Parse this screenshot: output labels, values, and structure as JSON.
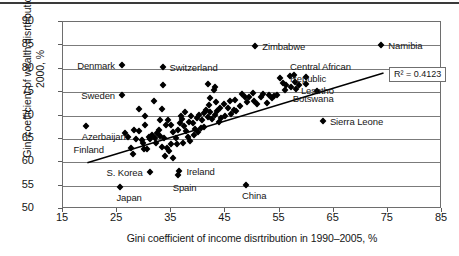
{
  "chart_data": {
    "type": "scatter",
    "title": "",
    "xlabel": "Gini coefficient of income disrtribution in 1990–2005, %",
    "ylabel": "Gini coefficient of wealth disrtribution in 2000, %",
    "xlim": [
      15,
      85
    ],
    "ylim": [
      50,
      90
    ],
    "xticks": [
      15,
      25,
      35,
      45,
      55,
      65,
      75,
      85
    ],
    "yticks": [
      50,
      55,
      60,
      65,
      70,
      75,
      80,
      85,
      90
    ],
    "grid": "horizontal",
    "legend": "none",
    "marker": "filled-diamond",
    "marker_color": "#000000",
    "trendline": {
      "type": "linear",
      "x_start": 19.5,
      "y_start": 59.9,
      "x_end": 74.2,
      "y_end": 79.1,
      "r_squared_label": "R² = 0.4123",
      "r_squared": 0.4123
    },
    "annotations": [
      {
        "label": "Namibia",
        "x": 73.8,
        "y": 85.0,
        "anchor": "right"
      },
      {
        "label": "Zimbabwe",
        "x": 50.5,
        "y": 84.8,
        "anchor": "right"
      },
      {
        "label": "Central African",
        "x": 61.0,
        "y": 80.5,
        "anchor": "none"
      },
      {
        "label": "Republic",
        "x": 61.0,
        "y": 78.0,
        "anchor": "none"
      },
      {
        "label": "Denmark",
        "x": 25.9,
        "y": 80.8,
        "anchor": "left"
      },
      {
        "label": "Switzerland",
        "x": 33.4,
        "y": 80.4,
        "anchor": "right"
      },
      {
        "label": "Lesotho",
        "x": 63.0,
        "y": 75.5,
        "anchor": "none"
      },
      {
        "label": "Botswana",
        "x": 61.5,
        "y": 73.8,
        "anchor": "none"
      },
      {
        "label": "Sweden",
        "x": 25.9,
        "y": 74.3,
        "anchor": "left"
      },
      {
        "label": "Sierra Leone",
        "x": 63.0,
        "y": 68.9,
        "anchor": "right"
      },
      {
        "label": "Azerbaijan",
        "x": 19.2,
        "y": 67.8,
        "anchor": "below"
      },
      {
        "label": "Finland",
        "x": 21.0,
        "y": 62.8,
        "anchor": "none"
      },
      {
        "label": "S. Korea",
        "x": 31.0,
        "y": 58.0,
        "anchor": "left"
      },
      {
        "label": "Ireland",
        "x": 36.5,
        "y": 58.2,
        "anchor": "right"
      },
      {
        "label": "Spain",
        "x": 36.0,
        "y": 56.9,
        "anchor": "below"
      },
      {
        "label": "Japan",
        "x": 25.6,
        "y": 54.8,
        "anchor": "below"
      },
      {
        "label": "China",
        "x": 48.8,
        "y": 55.1,
        "anchor": "below"
      }
    ],
    "points": [
      {
        "x": 73.8,
        "y": 85.0,
        "name": "Namibia"
      },
      {
        "x": 50.5,
        "y": 84.8,
        "name": "Zimbabwe"
      },
      {
        "x": 25.9,
        "y": 80.8,
        "name": "Denmark"
      },
      {
        "x": 33.4,
        "y": 80.4,
        "name": "Switzerland"
      },
      {
        "x": 25.9,
        "y": 74.3,
        "name": "Sweden"
      },
      {
        "x": 19.2,
        "y": 67.8,
        "name": "Azerbaijan"
      },
      {
        "x": 25.6,
        "y": 54.8,
        "name": "Japan"
      },
      {
        "x": 31.0,
        "y": 58.0,
        "name": "S. Korea"
      },
      {
        "x": 36.5,
        "y": 58.2,
        "name": "Ireland"
      },
      {
        "x": 36.2,
        "y": 57.3,
        "name": "Spain"
      },
      {
        "x": 48.8,
        "y": 55.1,
        "name": "China"
      },
      {
        "x": 63.0,
        "y": 68.9,
        "name": "Sierra Leone"
      },
      {
        "x": 62.0,
        "y": 75.2,
        "name": "Botswana"
      },
      {
        "x": 59.8,
        "y": 76.8,
        "name": "Central African Republic"
      },
      {
        "x": 33.5,
        "y": 76.5,
        "name": ""
      },
      {
        "x": 41.8,
        "y": 76.7,
        "name": ""
      },
      {
        "x": 43.0,
        "y": 76.0,
        "name": ""
      },
      {
        "x": 42.8,
        "y": 75.4,
        "name": ""
      },
      {
        "x": 29.0,
        "y": 71.4,
        "name": ""
      },
      {
        "x": 30.1,
        "y": 69.8,
        "name": ""
      },
      {
        "x": 31.8,
        "y": 73.1,
        "name": ""
      },
      {
        "x": 30.2,
        "y": 68.0,
        "name": ""
      },
      {
        "x": 33.3,
        "y": 71.3,
        "name": ""
      },
      {
        "x": 33.0,
        "y": 69.0,
        "name": ""
      },
      {
        "x": 42.2,
        "y": 73.8,
        "name": ""
      },
      {
        "x": 43.3,
        "y": 72.8,
        "name": ""
      },
      {
        "x": 44.0,
        "y": 71.5,
        "name": ""
      },
      {
        "x": 45.5,
        "y": 71.6,
        "name": ""
      },
      {
        "x": 46.5,
        "y": 71.2,
        "name": ""
      },
      {
        "x": 48.0,
        "y": 74.6,
        "name": ""
      },
      {
        "x": 48.6,
        "y": 74.0,
        "name": ""
      },
      {
        "x": 49.3,
        "y": 73.9,
        "name": ""
      },
      {
        "x": 50.2,
        "y": 73.2,
        "name": ""
      },
      {
        "x": 50.9,
        "y": 72.4,
        "name": ""
      },
      {
        "x": 52.0,
        "y": 74.5,
        "name": ""
      },
      {
        "x": 53.0,
        "y": 74.3,
        "name": ""
      },
      {
        "x": 54.0,
        "y": 74.1,
        "name": ""
      },
      {
        "x": 55.0,
        "y": 78.1,
        "name": ""
      },
      {
        "x": 56.2,
        "y": 76.5,
        "name": ""
      },
      {
        "x": 57.0,
        "y": 78.4,
        "name": ""
      },
      {
        "x": 57.6,
        "y": 78.6,
        "name": ""
      },
      {
        "x": 57.2,
        "y": 76.1,
        "name": ""
      },
      {
        "x": 58.0,
        "y": 75.6,
        "name": ""
      },
      {
        "x": 59.8,
        "y": 78.3,
        "name": ""
      },
      {
        "x": 27.0,
        "y": 65.3,
        "name": ""
      },
      {
        "x": 27.6,
        "y": 63.0,
        "name": ""
      },
      {
        "x": 28.0,
        "y": 61.7,
        "name": ""
      },
      {
        "x": 28.5,
        "y": 64.9,
        "name": ""
      },
      {
        "x": 29.0,
        "y": 66.7,
        "name": ""
      },
      {
        "x": 29.5,
        "y": 64.8,
        "name": ""
      },
      {
        "x": 30.0,
        "y": 62.8,
        "name": ""
      },
      {
        "x": 30.6,
        "y": 62.9,
        "name": ""
      },
      {
        "x": 31.0,
        "y": 64.9,
        "name": ""
      },
      {
        "x": 31.5,
        "y": 65.8,
        "name": ""
      },
      {
        "x": 32.0,
        "y": 65.1,
        "name": ""
      },
      {
        "x": 32.4,
        "y": 66.2,
        "name": ""
      },
      {
        "x": 32.8,
        "y": 67.0,
        "name": ""
      },
      {
        "x": 33.0,
        "y": 65.6,
        "name": ""
      },
      {
        "x": 33.6,
        "y": 65.2,
        "name": ""
      },
      {
        "x": 33.8,
        "y": 61.4,
        "name": ""
      },
      {
        "x": 34.6,
        "y": 62.3,
        "name": ""
      },
      {
        "x": 35.4,
        "y": 61.0,
        "name": ""
      },
      {
        "x": 34.0,
        "y": 68.0,
        "name": ""
      },
      {
        "x": 34.4,
        "y": 69.0,
        "name": ""
      },
      {
        "x": 35.0,
        "y": 67.9,
        "name": ""
      },
      {
        "x": 35.4,
        "y": 66.4,
        "name": ""
      },
      {
        "x": 35.8,
        "y": 65.2,
        "name": ""
      },
      {
        "x": 36.2,
        "y": 66.8,
        "name": ""
      },
      {
        "x": 36.6,
        "y": 68.3,
        "name": ""
      },
      {
        "x": 37.0,
        "y": 69.2,
        "name": ""
      },
      {
        "x": 37.4,
        "y": 67.8,
        "name": ""
      },
      {
        "x": 37.8,
        "y": 66.6,
        "name": ""
      },
      {
        "x": 38.2,
        "y": 68.6,
        "name": ""
      },
      {
        "x": 38.6,
        "y": 69.8,
        "name": ""
      },
      {
        "x": 39.0,
        "y": 68.4,
        "name": ""
      },
      {
        "x": 39.4,
        "y": 67.2,
        "name": ""
      },
      {
        "x": 39.8,
        "y": 69.4,
        "name": ""
      },
      {
        "x": 40.2,
        "y": 70.2,
        "name": ""
      },
      {
        "x": 40.6,
        "y": 69.0,
        "name": ""
      },
      {
        "x": 41.0,
        "y": 70.6,
        "name": ""
      },
      {
        "x": 41.4,
        "y": 71.1,
        "name": ""
      },
      {
        "x": 41.8,
        "y": 69.6,
        "name": ""
      },
      {
        "x": 42.2,
        "y": 70.8,
        "name": ""
      },
      {
        "x": 42.6,
        "y": 69.2,
        "name": ""
      },
      {
        "x": 43.0,
        "y": 70.2,
        "name": ""
      },
      {
        "x": 43.4,
        "y": 71.0,
        "name": ""
      },
      {
        "x": 40.0,
        "y": 66.4,
        "name": ""
      },
      {
        "x": 40.5,
        "y": 67.4,
        "name": ""
      },
      {
        "x": 38.0,
        "y": 65.4,
        "name": ""
      },
      {
        "x": 38.5,
        "y": 64.6,
        "name": ""
      },
      {
        "x": 36.0,
        "y": 63.8,
        "name": ""
      },
      {
        "x": 37.2,
        "y": 64.2,
        "name": ""
      },
      {
        "x": 44.2,
        "y": 69.4,
        "name": ""
      },
      {
        "x": 45.0,
        "y": 70.0,
        "name": ""
      },
      {
        "x": 46.0,
        "y": 70.4,
        "name": ""
      },
      {
        "x": 47.0,
        "y": 70.9,
        "name": ""
      },
      {
        "x": 47.6,
        "y": 72.0,
        "name": ""
      },
      {
        "x": 44.8,
        "y": 72.4,
        "name": ""
      },
      {
        "x": 45.8,
        "y": 73.0,
        "name": ""
      },
      {
        "x": 46.8,
        "y": 73.4,
        "name": ""
      },
      {
        "x": 51.5,
        "y": 74.0,
        "name": ""
      },
      {
        "x": 53.6,
        "y": 73.8,
        "name": ""
      },
      {
        "x": 54.6,
        "y": 74.3,
        "name": ""
      },
      {
        "x": 56.0,
        "y": 75.4,
        "name": ""
      },
      {
        "x": 58.6,
        "y": 76.6,
        "name": ""
      },
      {
        "x": 26.5,
        "y": 66.2,
        "name": ""
      },
      {
        "x": 28.2,
        "y": 67.0,
        "name": ""
      },
      {
        "x": 34.2,
        "y": 63.0,
        "name": ""
      },
      {
        "x": 35.0,
        "y": 64.0,
        "name": ""
      },
      {
        "x": 39.2,
        "y": 65.8,
        "name": ""
      },
      {
        "x": 41.0,
        "y": 67.6,
        "name": ""
      },
      {
        "x": 43.8,
        "y": 68.6,
        "name": ""
      },
      {
        "x": 36.8,
        "y": 70.0,
        "name": ""
      },
      {
        "x": 37.6,
        "y": 70.8,
        "name": ""
      },
      {
        "x": 30.8,
        "y": 65.4,
        "name": ""
      },
      {
        "x": 32.2,
        "y": 64.2,
        "name": ""
      },
      {
        "x": 29.8,
        "y": 64.2,
        "name": ""
      },
      {
        "x": 33.2,
        "y": 63.2,
        "name": ""
      },
      {
        "x": 42.0,
        "y": 72.2,
        "name": ""
      },
      {
        "x": 49.0,
        "y": 72.8,
        "name": ""
      },
      {
        "x": 50.0,
        "y": 74.9,
        "name": ""
      },
      {
        "x": 52.6,
        "y": 72.6,
        "name": ""
      },
      {
        "x": 55.6,
        "y": 77.0,
        "name": ""
      },
      {
        "x": 57.8,
        "y": 77.2,
        "name": ""
      }
    ]
  }
}
